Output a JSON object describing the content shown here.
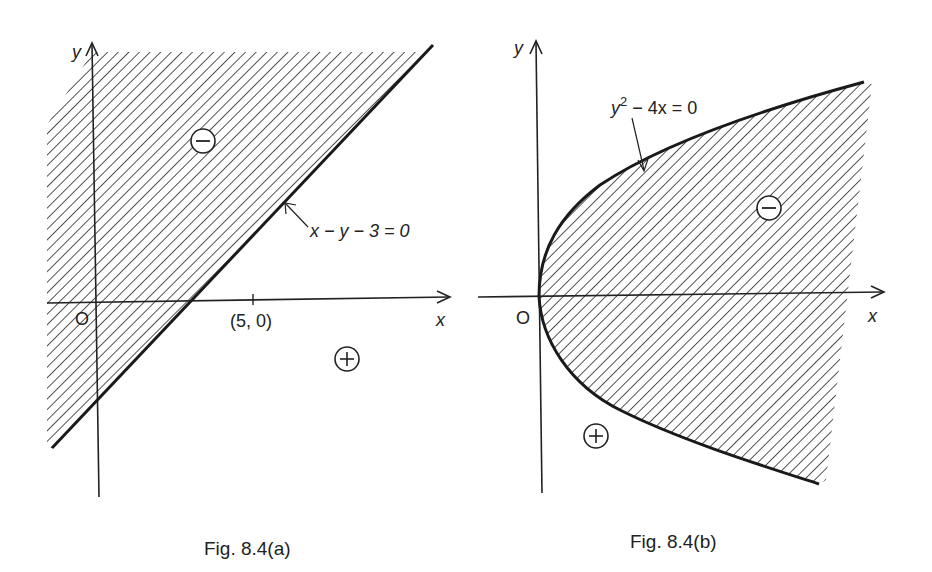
{
  "figures": [
    {
      "id": "a",
      "caption": "Fig. 8.4(a)",
      "axes": {
        "x_label": "x",
        "y_label": "y",
        "origin_label": "O"
      },
      "tick": {
        "label": "(5, 0)"
      },
      "boundary": {
        "equation": "x − y − 3 = 0",
        "type": "line"
      },
      "regions": {
        "shaded_sign": "−",
        "unshaded_sign": "+"
      }
    },
    {
      "id": "b",
      "caption": "Fig. 8.4(b)",
      "axes": {
        "x_label": "x",
        "y_label": "y",
        "origin_label": "O"
      },
      "boundary": {
        "equation_base": "y",
        "equation_exp": "2",
        "equation_rest": " − 4x = 0",
        "type": "parabola"
      },
      "regions": {
        "shaded_sign": "−",
        "unshaded_sign": "+"
      }
    }
  ],
  "colors": {
    "ink": "#222222",
    "background": "#ffffff"
  }
}
